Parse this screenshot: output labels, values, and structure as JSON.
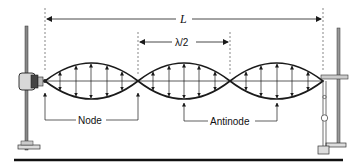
{
  "diagram": {
    "labels": {
      "length": "L",
      "half_wavelength": "λ/2",
      "node": "Node",
      "antinode": "Antinode"
    },
    "loops": 3,
    "node_x": [
      45,
      138,
      230,
      323
    ],
    "string_y": 81,
    "amplitude": 18,
    "colors": {
      "stroke": "#1a1a1a",
      "stand": "#777777",
      "background": "#ffffff"
    }
  }
}
